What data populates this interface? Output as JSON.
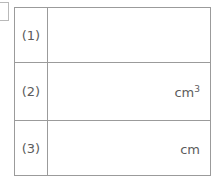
{
  "worksheet": {
    "partial_box_label": "",
    "table": {
      "rows": [
        {
          "label": "(1)",
          "answer_value": "",
          "unit": "",
          "unit_base": "",
          "unit_exponent": ""
        },
        {
          "label": "(2)",
          "answer_value": "",
          "unit": "cm3",
          "unit_base": "cm",
          "unit_exponent": "3"
        },
        {
          "label": "(3)",
          "answer_value": "",
          "unit": "cm",
          "unit_base": "cm",
          "unit_exponent": ""
        }
      ]
    },
    "colors": {
      "border": "#9b9b9b",
      "text": "#5c5c5c",
      "background": "#ffffff",
      "partial_box_border": "#b9b9b9"
    }
  }
}
